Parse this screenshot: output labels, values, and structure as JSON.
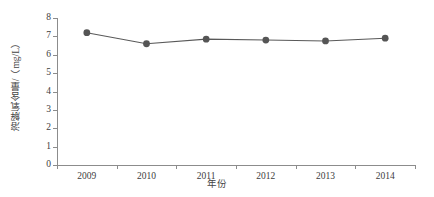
{
  "chart_data": {
    "type": "line",
    "title": "",
    "xlabel": "年份",
    "ylabel": "溶解氧含量/（mg/L）",
    "categories": [
      "2009",
      "2010",
      "2011",
      "2012",
      "2013",
      "2014"
    ],
    "values": [
      7.2,
      6.6,
      6.85,
      6.8,
      6.75,
      6.9
    ],
    "series": [
      {
        "name": "溶解氧含量",
        "values": [
          7.2,
          6.6,
          6.85,
          6.8,
          6.75,
          6.9
        ]
      }
    ],
    "ylim": [
      0,
      8
    ],
    "yticks": [
      "0",
      "1",
      "2",
      "3",
      "4",
      "5",
      "6",
      "7",
      "8"
    ],
    "xticks": [
      "2009",
      "2010",
      "2011",
      "2012",
      "2013",
      "2014"
    ],
    "grid": false,
    "legend": "none",
    "marker": "circle",
    "colors": {
      "line": "#595959",
      "marker": "#555555",
      "axis": "#8c8c8c",
      "text": "#3d3d3d",
      "background": "#ffffff"
    }
  }
}
